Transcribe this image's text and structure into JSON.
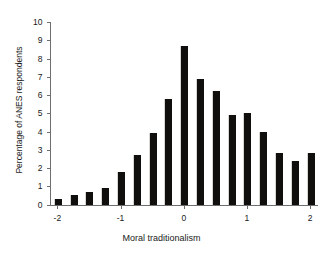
{
  "chart_data": {
    "type": "bar",
    "title": "",
    "xlabel": "Moral traditionalism",
    "ylabel": "Percentage of ANES respondents",
    "xlim": [
      -2.125,
      2.125
    ],
    "ylim": [
      0,
      10
    ],
    "grid": false,
    "legend": null,
    "bar_color": "#100f0d",
    "axis_color": "#6e6e6e",
    "x": [
      -2.0,
      -1.75,
      -1.5,
      -1.25,
      -1.0,
      -0.75,
      -0.5,
      -0.25,
      0.0,
      0.25,
      0.5,
      0.75,
      1.0,
      1.25,
      1.5,
      1.75,
      2.0
    ],
    "values": [
      0.3,
      0.5,
      0.7,
      0.9,
      1.8,
      2.7,
      3.9,
      5.8,
      8.7,
      6.9,
      6.2,
      4.9,
      5.0,
      4.0,
      2.8,
      2.4,
      2.8
    ],
    "xticks": [
      {
        "value": -2,
        "label": "-2"
      },
      {
        "value": -1,
        "label": "-1"
      },
      {
        "value": 0,
        "label": "0"
      },
      {
        "value": 1,
        "label": "1"
      },
      {
        "value": 2,
        "label": "2"
      }
    ],
    "yticks": [
      {
        "value": 0,
        "label": "0"
      },
      {
        "value": 1,
        "label": "1"
      },
      {
        "value": 2,
        "label": "2"
      },
      {
        "value": 3,
        "label": "3"
      },
      {
        "value": 4,
        "label": "4"
      },
      {
        "value": 5,
        "label": "5"
      },
      {
        "value": 6,
        "label": "6"
      },
      {
        "value": 7,
        "label": "7"
      },
      {
        "value": 8,
        "label": "8"
      },
      {
        "value": 9,
        "label": "9"
      },
      {
        "value": 10,
        "label": "10"
      }
    ]
  }
}
